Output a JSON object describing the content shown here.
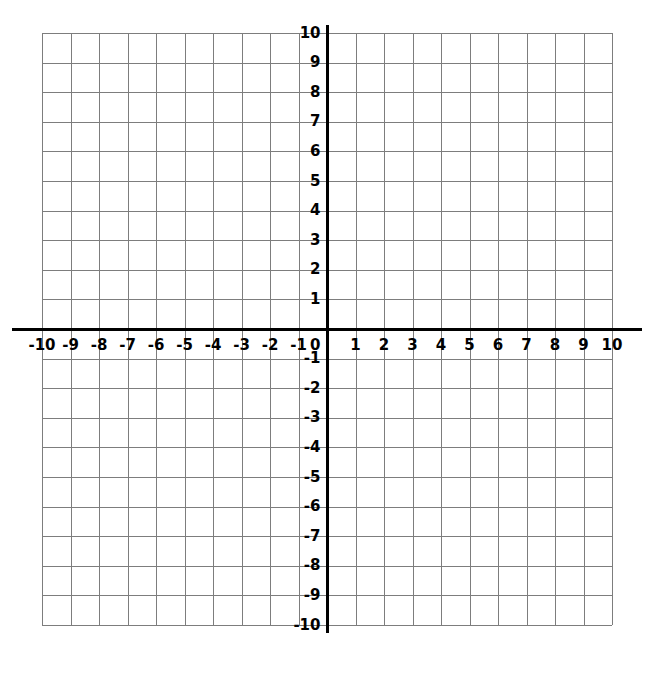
{
  "chart_data": {
    "type": "grid",
    "title": "",
    "subtitle": "",
    "xlabel": "",
    "ylabel": "",
    "xlim": [
      -10,
      10
    ],
    "ylim": [
      -10,
      10
    ],
    "x_ticks": [
      -10,
      -9,
      -8,
      -7,
      -6,
      -5,
      -4,
      -3,
      -2,
      -1,
      0,
      1,
      2,
      3,
      4,
      5,
      6,
      7,
      8,
      9,
      10
    ],
    "y_ticks": [
      10,
      9,
      8,
      7,
      6,
      5,
      4,
      3,
      2,
      1,
      -1,
      -2,
      -3,
      -4,
      -5,
      -6,
      -7,
      -8,
      -9,
      -10
    ],
    "x_tick_labels": [
      "-10",
      "-9",
      "-8",
      "-7",
      "-6",
      "-5",
      "-4",
      "-3",
      "-2",
      "-1",
      "0",
      "1",
      "2",
      "3",
      "4",
      "5",
      "6",
      "7",
      "8",
      "9",
      "10"
    ],
    "y_tick_labels": [
      "10",
      "9",
      "8",
      "7",
      "6",
      "5",
      "4",
      "3",
      "2",
      "1",
      "-1",
      "-2",
      "-3",
      "-4",
      "-5",
      "-6",
      "-7",
      "-8",
      "-9",
      "-10"
    ],
    "origin_label": "0",
    "grid": true,
    "grid_step": 1,
    "legend": null,
    "series": [],
    "annotations": [],
    "colors": {
      "background": "#ffffff",
      "gridline": "#7d7d7d",
      "axis": "#000000",
      "label": "#000000"
    },
    "geometry": {
      "left": 42,
      "right": 612,
      "top": 33,
      "bottom": 625,
      "origin_x": 327,
      "origin_y": 329,
      "cell_width": 28.5,
      "cell_height": 29.6
    }
  }
}
